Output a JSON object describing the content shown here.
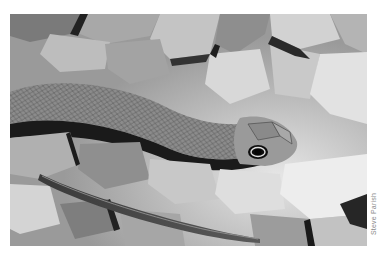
{
  "photo": {
    "subject": "snake-on-rocks",
    "description": "Black and white photograph of a slender snake resting on gravel and rocks, head with large eye facing right",
    "tone": "grayscale"
  },
  "credit": {
    "text": "Steve Parish"
  },
  "colors": {
    "background": "#ffffff",
    "credit_text": "#8a8a8a"
  }
}
